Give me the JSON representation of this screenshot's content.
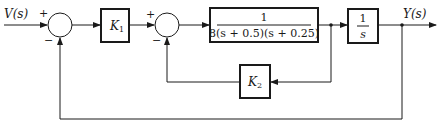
{
  "diagram": {
    "type": "block-diagram",
    "input": {
      "label": "V(s)"
    },
    "output": {
      "label": "Y(s)"
    },
    "summing_junctions": [
      {
        "id": "sum1",
        "signs": {
          "input": "+",
          "feedback": "−"
        }
      },
      {
        "id": "sum2",
        "signs": {
          "input": "+",
          "feedback": "−"
        }
      }
    ],
    "blocks": [
      {
        "id": "k1",
        "label": "K",
        "subscript": "1"
      },
      {
        "id": "plant",
        "numerator": "1",
        "denominator": "8(s + 0.5)(s + 0.25)"
      },
      {
        "id": "integrator",
        "numerator": "1",
        "denominator": "s"
      },
      {
        "id": "k2",
        "label": "K",
        "subscript": "2"
      }
    ],
    "connections": [
      "V(s) -> sum1(+)",
      "sum1 -> K1",
      "K1 -> sum2(+)",
      "sum2 -> plant",
      "plant -> integrator",
      "integrator -> Y(s)",
      "plant output -> K2 -> sum2(-)",
      "Y(s) -> sum1(-)"
    ]
  }
}
